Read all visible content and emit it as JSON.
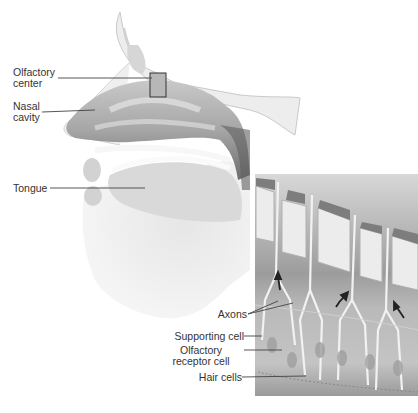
{
  "figure": {
    "head_labels": [
      {
        "id": "olfactory-center",
        "line1": "Olfactory",
        "line2": "center"
      },
      {
        "id": "nasal-cavity",
        "line1": "Nasal",
        "line2": "cavity"
      },
      {
        "id": "tongue",
        "line1": "Tongue"
      }
    ],
    "inset_labels": [
      {
        "id": "axons",
        "line1": "Axons"
      },
      {
        "id": "supporting-cell",
        "line1": "Supporting cell"
      },
      {
        "id": "olfactory-receptor-cell",
        "line1": "Olfactory",
        "line2": "receptor cell"
      },
      {
        "id": "hair-cells",
        "line1": "Hair cells"
      }
    ]
  },
  "colors": {
    "background": "#ffffff",
    "label_text": "#333333",
    "leader_line": "#444444",
    "inset_bg": "#9a9a9a",
    "bone": "#e8e8e8",
    "cavity_dark": "#7a7a7a"
  }
}
